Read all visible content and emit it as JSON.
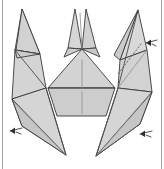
{
  "figure": {
    "title": "Origami fold step diagram",
    "caption": "",
    "background_color": "#ffffff",
    "paper_fill_light": "#dcdcdc",
    "paper_fill_mid": "#cfcfcf",
    "paper_fill_dark": "#c2c2c2",
    "paper_fill_white": "#ffffff",
    "outline_color": "#3a3a3a",
    "crease_color": "#8d8d8d",
    "dashed_fold_color": "#5a5a5a",
    "arrow_color": "#2e2e2e",
    "border_rule_color": "#9a9a9a"
  },
  "annotations": {
    "arrows": [
      {
        "name": "arrow-right-upper",
        "label": "",
        "position": {
          "x": 148,
          "y": 42
        },
        "direction": "left",
        "style": "double-barb-pleat"
      },
      {
        "name": "arrow-left-lower",
        "label": "",
        "position": {
          "x": 13,
          "y": 131
        },
        "direction": "left",
        "style": "double-barb-pleat"
      },
      {
        "name": "arrow-right-lower",
        "label": "",
        "position": {
          "x": 143,
          "y": 134
        },
        "direction": "left",
        "style": "double-barb-pleat"
      }
    ],
    "dashed_fold_lines": [
      {
        "name": "dashed-fold-right-wing",
        "from": {
          "x": 141,
          "y": 44
        },
        "to": {
          "x": 118,
          "y": 74
        }
      }
    ]
  },
  "shapes": {
    "left_top_spike": "narrow triangular flap pointing up-left",
    "center_top_spike": "twin thin points forming the head",
    "right_top_spike": "narrow triangular flap pointing up-right",
    "center_body": "triangle over trapezoid torso with vertical center crease",
    "left_lower_wing": "long tapered leg with inner diagonal crease",
    "right_lower_wing": "long tapered leg with inner diagonal crease"
  }
}
